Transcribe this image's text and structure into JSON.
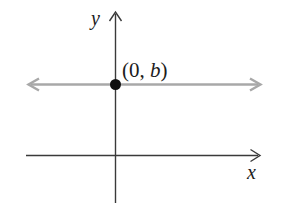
{
  "diagram": {
    "labels": {
      "y_axis": "y",
      "x_axis": "x",
      "point_open": "(0, ",
      "point_var": "b",
      "point_close": ")"
    },
    "colors": {
      "axis": "#3a3a3a",
      "line": "#a8a8a8",
      "point": "#0f0f0f",
      "text": "#1c1c1c"
    }
  }
}
